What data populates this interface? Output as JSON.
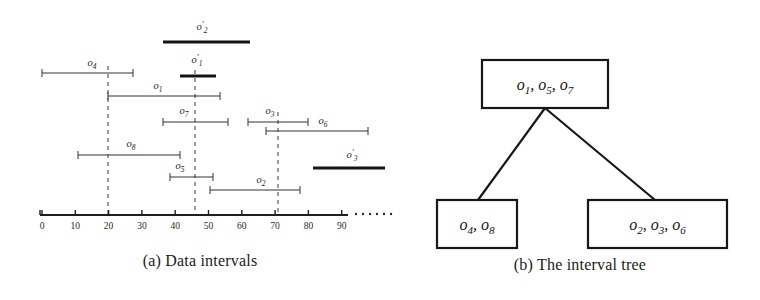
{
  "figure": {
    "width": 760,
    "height": 300,
    "background": "#ffffff",
    "ink_color": "#1a1a1a"
  },
  "panel_a": {
    "caption": "(a) Data intervals",
    "axis": {
      "min": 0,
      "max": 90,
      "tick_step": 10,
      "tick_labels": [
        "0",
        "10",
        "20",
        "30",
        "40",
        "50",
        "60",
        "70",
        "80",
        "90"
      ],
      "tick_values": [
        0,
        10,
        20,
        30,
        40,
        50,
        60,
        70,
        80,
        90
      ],
      "continuation": "......",
      "px_origin": 42,
      "px_per_unit": 3.33,
      "px_y": 215,
      "px_end": 348
    },
    "split_lines": [
      {
        "name": "split-20",
        "value": 20,
        "px_x": 108,
        "px_top": 66,
        "px_bottom": 215
      },
      {
        "name": "split-46",
        "value": 46,
        "px_x": 195,
        "px_top": 70,
        "px_bottom": 215
      },
      {
        "name": "split-70",
        "value": 70,
        "px_x": 278,
        "px_top": 112,
        "px_bottom": 215
      }
    ],
    "intervals": [
      {
        "id": "o2p",
        "label": "o",
        "sub": "2",
        "prime": true,
        "style": "bold",
        "start": 36,
        "end": 62,
        "px_x1": 163,
        "px_x2": 250,
        "px_y": 42,
        "label_px_x": 202,
        "label_px_y": 30
      },
      {
        "id": "o4",
        "label": "o",
        "sub": "4",
        "prime": false,
        "style": "thin",
        "start": 0,
        "end": 27,
        "px_x1": 42,
        "px_x2": 133,
        "px_y": 73,
        "label_px_x": 92,
        "label_px_y": 66
      },
      {
        "id": "o1p",
        "label": "o",
        "sub": "1",
        "prime": true,
        "style": "bold",
        "start": 41,
        "end": 52,
        "px_x1": 180,
        "px_x2": 216,
        "px_y": 76,
        "label_px_x": 197,
        "label_px_y": 63
      },
      {
        "id": "o1",
        "label": "o",
        "sub": "1",
        "prime": false,
        "style": "thin",
        "start": 20,
        "end": 53,
        "px_x1": 108,
        "px_x2": 220,
        "px_y": 96,
        "label_px_x": 158,
        "label_px_y": 89
      },
      {
        "id": "o7",
        "label": "o",
        "sub": "7",
        "prime": false,
        "style": "thin",
        "start": 36,
        "end": 56,
        "px_x1": 163,
        "px_x2": 228,
        "px_y": 122,
        "label_px_x": 184,
        "label_px_y": 114
      },
      {
        "id": "o3",
        "label": "o",
        "sub": "3",
        "prime": false,
        "style": "thin",
        "start": 62,
        "end": 80,
        "px_x1": 248,
        "px_x2": 308,
        "px_y": 122,
        "label_px_x": 270,
        "label_px_y": 114
      },
      {
        "id": "o6",
        "label": "o",
        "sub": "6",
        "prime": false,
        "style": "thin",
        "start": 67,
        "end": 98,
        "px_x1": 266,
        "px_x2": 368,
        "px_y": 131,
        "label_px_x": 323,
        "label_px_y": 124
      },
      {
        "id": "o8",
        "label": "o",
        "sub": "8",
        "prime": false,
        "style": "thin",
        "start": 11,
        "end": 41,
        "px_x1": 78,
        "px_x2": 180,
        "px_y": 155,
        "label_px_x": 131,
        "label_px_y": 147
      },
      {
        "id": "o3p",
        "label": "o",
        "sub": "3",
        "prime": true,
        "style": "bold",
        "start": 81,
        "end": 103,
        "px_x1": 313,
        "px_x2": 385,
        "px_y": 168,
        "label_px_x": 352,
        "label_px_y": 158
      },
      {
        "id": "o5",
        "label": "o",
        "sub": "5",
        "prime": false,
        "style": "thin",
        "start": 38,
        "end": 51,
        "px_x1": 170,
        "px_x2": 213,
        "px_y": 177,
        "label_px_x": 180,
        "label_px_y": 169
      },
      {
        "id": "o2",
        "label": "o",
        "sub": "2",
        "prime": false,
        "style": "thin",
        "start": 50,
        "end": 77,
        "px_x1": 210,
        "px_x2": 300,
        "px_y": 190,
        "label_px_x": 261,
        "label_px_y": 183
      }
    ]
  },
  "panel_b": {
    "caption": "(b) The interval tree",
    "nodes": [
      {
        "id": "root",
        "name": "root-node",
        "items": [
          {
            "label": "o",
            "sub": "1"
          },
          {
            "label": "o",
            "sub": "5"
          },
          {
            "label": "o",
            "sub": "7"
          }
        ],
        "text": "o1, o5, o7",
        "px_x": 482,
        "px_y": 60,
        "px_w": 126,
        "px_h": 48
      },
      {
        "id": "left",
        "name": "left-child-node",
        "items": [
          {
            "label": "o",
            "sub": "4"
          },
          {
            "label": "o",
            "sub": "8"
          }
        ],
        "text": "o4, o8",
        "px_x": 437,
        "px_y": 200,
        "px_w": 80,
        "px_h": 48
      },
      {
        "id": "right",
        "name": "right-child-node",
        "items": [
          {
            "label": "o",
            "sub": "2"
          },
          {
            "label": "o",
            "sub": "3"
          },
          {
            "label": "o",
            "sub": "6"
          }
        ],
        "text": "o2, o3, o6",
        "px_x": 588,
        "px_y": 200,
        "px_w": 139,
        "px_h": 48
      }
    ],
    "edges": [
      {
        "id": "root-left",
        "name": "edge-root-to-left",
        "px_x1": 545,
        "px_y1": 108,
        "px_x2": 478,
        "px_y2": 200
      },
      {
        "id": "root-right",
        "name": "edge-root-to-right",
        "px_x1": 545,
        "px_y1": 108,
        "px_x2": 655,
        "px_y2": 200
      }
    ]
  }
}
